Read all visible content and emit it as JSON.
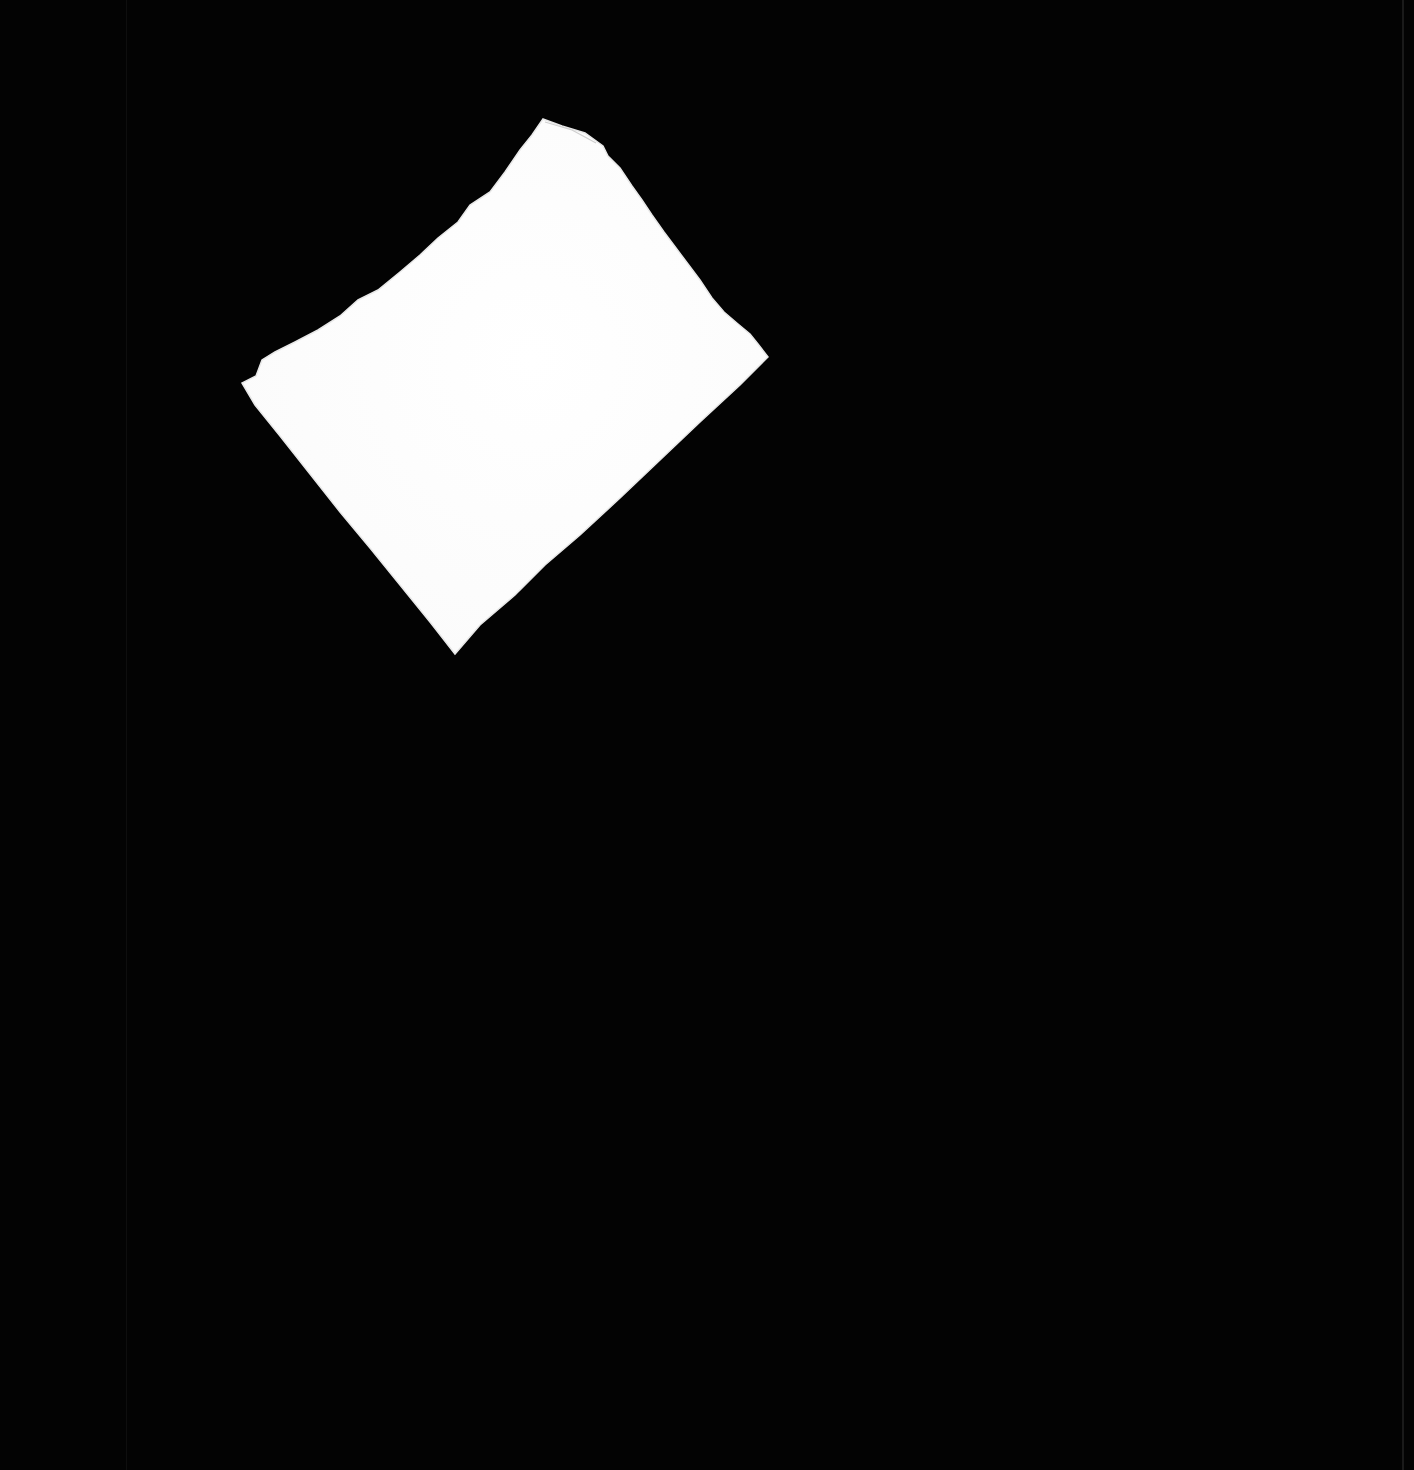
{
  "image": {
    "description": "Blank torn scrap of white paper, rotated, on a black background",
    "background_color": "#030303",
    "paper_color": "#fdfdfd",
    "paper_shadow_color": "#e6e6e6",
    "canvas": {
      "width": 1414,
      "height": 1470
    },
    "paper_polygon": [
      [
        543,
        119
      ],
      [
        562,
        126
      ],
      [
        585,
        133
      ],
      [
        603,
        146
      ],
      [
        608,
        156
      ],
      [
        620,
        168
      ],
      [
        632,
        186
      ],
      [
        642,
        200
      ],
      [
        652,
        215
      ],
      [
        664,
        232
      ],
      [
        676,
        248
      ],
      [
        688,
        264
      ],
      [
        700,
        280
      ],
      [
        712,
        298
      ],
      [
        724,
        312
      ],
      [
        738,
        324
      ],
      [
        750,
        334
      ],
      [
        758,
        344
      ],
      [
        768,
        357
      ],
      [
        740,
        385
      ],
      [
        700,
        422
      ],
      [
        660,
        460
      ],
      [
        620,
        498
      ],
      [
        580,
        535
      ],
      [
        545,
        565
      ],
      [
        515,
        595
      ],
      [
        480,
        625
      ],
      [
        455,
        654
      ],
      [
        430,
        622
      ],
      [
        400,
        585
      ],
      [
        370,
        548
      ],
      [
        340,
        512
      ],
      [
        310,
        474
      ],
      [
        280,
        436
      ],
      [
        255,
        405
      ],
      [
        242,
        383
      ],
      [
        256,
        376
      ],
      [
        262,
        360
      ],
      [
        275,
        352
      ],
      [
        295,
        342
      ],
      [
        318,
        330
      ],
      [
        340,
        316
      ],
      [
        358,
        300
      ],
      [
        378,
        290
      ],
      [
        400,
        272
      ],
      [
        420,
        255
      ],
      [
        438,
        238
      ],
      [
        458,
        222
      ],
      [
        470,
        205
      ],
      [
        490,
        192
      ],
      [
        505,
        172
      ],
      [
        520,
        150
      ],
      [
        532,
        135
      ]
    ],
    "scanner_lines_x": [
      126,
      1403
    ]
  }
}
